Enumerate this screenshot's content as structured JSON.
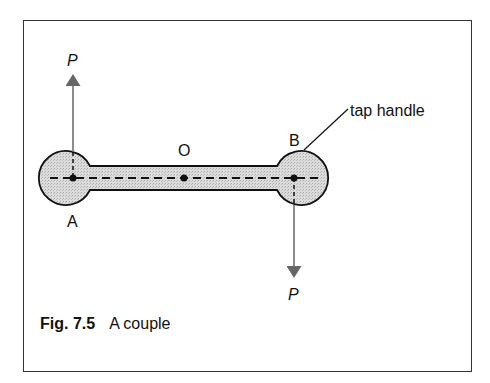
{
  "figure": {
    "number": "Fig. 7.5",
    "title": "A couple"
  },
  "labels": {
    "force_top": "P",
    "force_bottom": "P",
    "point_a": "A",
    "point_o": "O",
    "point_b": "B",
    "callout": "tap handle"
  },
  "colors": {
    "handle_fill": "#d4d4d4",
    "outline": "#111111",
    "arrow": "#666666"
  }
}
